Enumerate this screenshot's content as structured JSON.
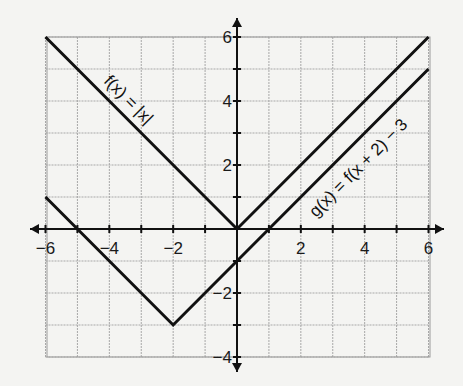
{
  "chart_data": {
    "type": "line",
    "title": "",
    "xlabel": "",
    "ylabel": "",
    "xlim": [
      -6,
      6
    ],
    "ylim": [
      -4,
      6
    ],
    "grid": true,
    "x_ticks": [
      -6,
      -4,
      -2,
      2,
      4,
      6
    ],
    "y_ticks": [
      6,
      4,
      2,
      -2,
      -4
    ],
    "x_tick_labels": [
      "−6",
      "−4",
      "−2",
      "2",
      "4",
      "6"
    ],
    "y_tick_labels": [
      "6",
      "4",
      "2",
      "−2",
      "−4"
    ],
    "series": [
      {
        "name": "f(x) = |x|",
        "label": "f(x) = |x|",
        "points": [
          [
            -6,
            6
          ],
          [
            0,
            0
          ],
          [
            6,
            6
          ]
        ]
      },
      {
        "name": "g(x) = f(x + 2) − 3",
        "label": "g(x) = f(x + 2) − 3",
        "points": [
          [
            -6,
            1
          ],
          [
            -2,
            -3
          ],
          [
            6,
            5
          ]
        ]
      }
    ]
  }
}
